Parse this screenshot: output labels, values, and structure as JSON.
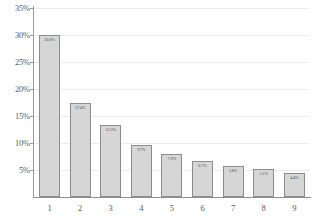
{
  "chart_data": {
    "type": "bar",
    "title": "",
    "subtitle": "",
    "xlabel": "",
    "ylabel": "",
    "categories": [
      "1",
      "2",
      "3",
      "4",
      "5",
      "6",
      "7",
      "8",
      "9"
    ],
    "values": [
      30.0,
      17.4,
      13.3,
      9.7,
      7.9,
      6.7,
      5.8,
      5.1,
      4.4
    ],
    "data_labels": [
      "30.0%",
      "17.4%",
      "13.3%",
      "9.7%",
      "7.9%",
      "6.7%",
      "5.8%",
      "5.1%",
      "4.4%"
    ],
    "ylim": [
      0,
      35
    ],
    "ytick_values": [
      5,
      10,
      15,
      20,
      25,
      30,
      35
    ],
    "ytick_labels": [
      "5%",
      "10%",
      "15%",
      "20%",
      "25%",
      "30%",
      "35%"
    ],
    "grid": true,
    "legend": false,
    "legend_position": "none",
    "bar_fill_color": "#d6d6d6",
    "bar_border_color": "#8c8c8c",
    "grid_color": "#ededed",
    "axis_color": "#8f8f8f",
    "background_color": "#ffffff"
  }
}
